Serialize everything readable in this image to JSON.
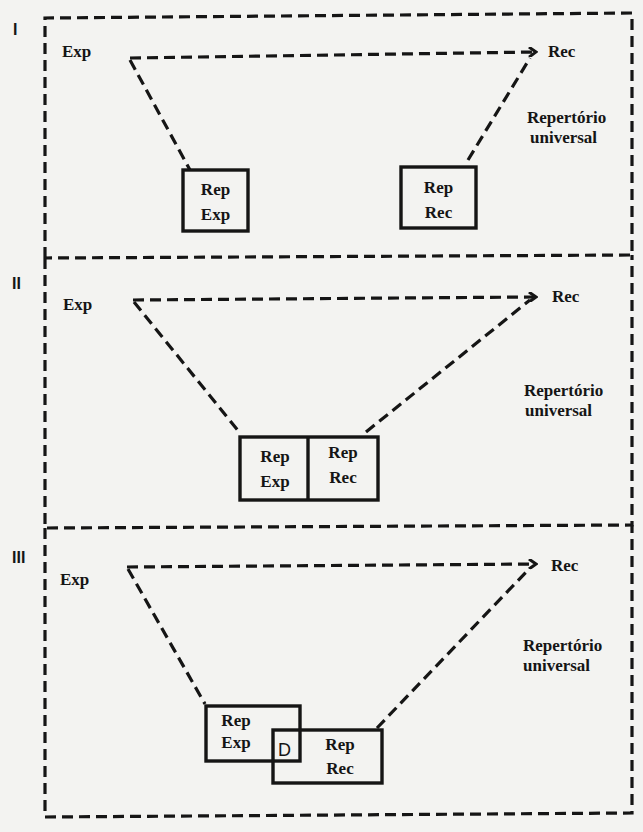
{
  "figure": {
    "panels": [
      {
        "numeral": "I",
        "sender": "Exp",
        "receiver": "Rec",
        "universe": [
          "Repertório",
          "universal"
        ],
        "sender_repertoire": [
          "Rep",
          "Exp"
        ],
        "receiver_repertoire": [
          "Rep",
          "Rec"
        ],
        "relation": "disjoint"
      },
      {
        "numeral": "II",
        "sender": "Exp",
        "receiver": "Rec",
        "universe": [
          "Repertório",
          "universal"
        ],
        "sender_repertoire": [
          "Rep",
          "Exp"
        ],
        "receiver_repertoire": [
          "Rep",
          "Rec"
        ],
        "relation": "adjacent"
      },
      {
        "numeral": "III",
        "sender": "Exp",
        "receiver": "Rec",
        "universe": [
          "Repertório",
          "universal"
        ],
        "sender_repertoire": [
          "Rep",
          "Exp"
        ],
        "receiver_repertoire": [
          "Rep",
          "Rec"
        ],
        "intersection_label": "D",
        "relation": "overlapping"
      }
    ],
    "colors": {
      "ink": "#151515",
      "paper": "#f3f3f1"
    }
  }
}
